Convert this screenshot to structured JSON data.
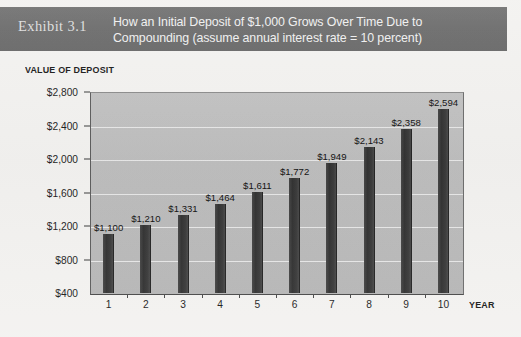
{
  "header": {
    "exhibit_label": "Exhibit 3.1",
    "title_line1": "How an Initial Deposit of $1,000 Grows Over Time Due to",
    "title_line2": "Compounding (assume annual interest rate = 10 percent)",
    "band_color": "#6f6f6f",
    "text_color": "#f0f0f0"
  },
  "chart_data": {
    "type": "bar",
    "title": "How an Initial Deposit of $1,000 Grows Over Time Due to Compounding (assume annual interest rate = 10 percent)",
    "xlabel": "YEAR",
    "ylabel": "VALUE OF DEPOSIT",
    "categories": [
      "1",
      "2",
      "3",
      "4",
      "5",
      "6",
      "7",
      "8",
      "9",
      "10"
    ],
    "values": [
      1100,
      1210,
      1331,
      1464,
      1611,
      1772,
      1949,
      2143,
      2358,
      2594
    ],
    "value_labels": [
      "$1,100",
      "$1,210",
      "$1,331",
      "$1,464",
      "$1,611",
      "$1,772",
      "$1,949",
      "$2,143",
      "$2,358",
      "$2,594"
    ],
    "ylim": [
      400,
      2800
    ],
    "ytick_values": [
      400,
      800,
      1200,
      1600,
      2000,
      2400,
      2800
    ],
    "ytick_labels": [
      "$400",
      "$800",
      "$1,200",
      "$1,600",
      "$2,000",
      "$2,400",
      "$2,800"
    ],
    "grid": true,
    "legend": "none",
    "bar_color": "#3b3b3b",
    "plot_background": "#bdbdbd",
    "gridline_color": "#efefef"
  }
}
